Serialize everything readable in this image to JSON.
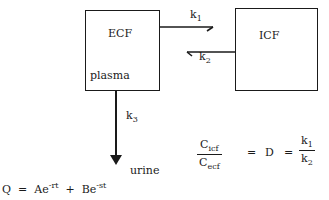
{
  "diagram": {
    "compartments": [
      {
        "id": "ecf",
        "label": "ECF",
        "sublabel": "plasma"
      },
      {
        "id": "icf",
        "label": "ICF"
      }
    ],
    "rates": {
      "k1": {
        "base": "k",
        "sub": "1"
      },
      "k2": {
        "base": "k",
        "sub": "2"
      },
      "k3": {
        "base": "k",
        "sub": "3"
      }
    },
    "output": "urine",
    "ratio_equation": {
      "numerator": {
        "base": "C",
        "sub": "icf"
      },
      "denominator": {
        "base": "C",
        "sub": "ecf"
      },
      "eq1": "=",
      "middle": "D",
      "eq2": "=",
      "rhs_numerator": {
        "base": "k",
        "sub": "1"
      },
      "rhs_denominator": {
        "base": "k",
        "sub": "2"
      }
    },
    "q_equation": {
      "lhs": "Q",
      "eq": "=",
      "term1_base": "Ae",
      "term1_exp": "-rt",
      "plus": "+",
      "term2_base": "Be",
      "term2_exp": "-st"
    }
  }
}
